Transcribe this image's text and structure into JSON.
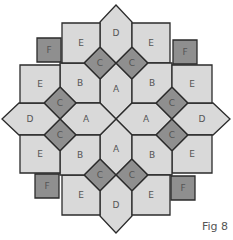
{
  "figure": {
    "caption": "Fig 8",
    "colors": {
      "light": "#d9d9d9",
      "dark": "#8f8f8f",
      "stroke": "#2b2b2b",
      "label": "#555555"
    },
    "pieces": {
      "A": "A",
      "B": "B",
      "C": "C",
      "D": "D",
      "E": "E",
      "F": "F"
    },
    "counts": {
      "A": 4,
      "B": 4,
      "C": 8,
      "D": 4,
      "E": 8,
      "F": 4
    }
  }
}
